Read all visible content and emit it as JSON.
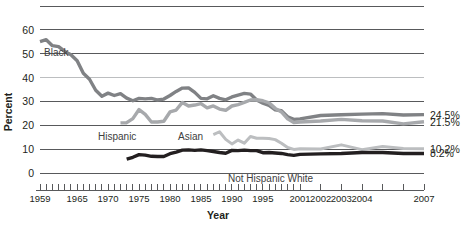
{
  "chart_data": {
    "type": "line",
    "title": "",
    "xlabel": "Year",
    "ylabel": "Percent",
    "ylim": [
      0,
      65
    ],
    "yticks": [
      0,
      10,
      20,
      30,
      40,
      50,
      60
    ],
    "xlim": [
      1959,
      2007
    ],
    "xticklabels": [
      "1959",
      "1965",
      "1970",
      "1975",
      "1980",
      "1985",
      "1990",
      "1995",
      "2001",
      "2002",
      "2003",
      "2004",
      "2007"
    ],
    "grid": true,
    "legend_position": "inline-annotations",
    "series": [
      {
        "name": "Black",
        "label": "Black",
        "color": "#808285",
        "end_value_label": "24.5%",
        "end_value": 24.5,
        "x": [
          1959,
          1960,
          1961,
          1962,
          1963,
          1964,
          1965,
          1966,
          1967,
          1968,
          1969,
          1970,
          1971,
          1972,
          1973,
          1974,
          1975,
          1976,
          1977,
          1978,
          1979,
          1980,
          1981,
          1982,
          1983,
          1984,
          1985,
          1986,
          1987,
          1988,
          1989,
          1990,
          1991,
          1992,
          1993,
          1994,
          1995,
          1996,
          1997,
          1998,
          1999,
          2000,
          2001,
          2002,
          2003,
          2004,
          2005,
          2006,
          2007
        ],
        "y": [
          55.1,
          55.9,
          53.4,
          53.0,
          51.0,
          49.6,
          47.1,
          41.8,
          39.3,
          34.7,
          32.2,
          33.5,
          32.5,
          33.3,
          31.4,
          30.3,
          31.3,
          31.1,
          31.3,
          30.6,
          31.0,
          32.5,
          34.2,
          35.6,
          35.7,
          33.8,
          31.3,
          31.1,
          32.4,
          31.3,
          30.7,
          31.9,
          32.7,
          33.4,
          33.1,
          30.6,
          29.3,
          28.4,
          26.5,
          26.1,
          23.6,
          22.5,
          22.7,
          24.1,
          24.4,
          24.7,
          24.9,
          24.3,
          24.5
        ]
      },
      {
        "name": "Hispanic",
        "label": "Hispanic",
        "color": "#a7a9ac",
        "end_value_label": "21.5%",
        "end_value": 21.5,
        "x": [
          1972,
          1973,
          1974,
          1975,
          1976,
          1977,
          1978,
          1979,
          1980,
          1981,
          1982,
          1983,
          1984,
          1985,
          1986,
          1987,
          1988,
          1989,
          1990,
          1991,
          1992,
          1993,
          1994,
          1995,
          1996,
          1997,
          1998,
          1999,
          2000,
          2001,
          2002,
          2003,
          2004,
          2005,
          2006,
          2007
        ],
        "y": [
          21.0,
          21.1,
          22.8,
          26.6,
          24.6,
          21.4,
          21.4,
          21.7,
          25.6,
          26.4,
          29.6,
          28.1,
          28.5,
          29.1,
          27.3,
          28.1,
          26.8,
          26.3,
          28.1,
          28.7,
          29.6,
          30.6,
          30.7,
          30.3,
          29.4,
          27.1,
          25.6,
          22.7,
          21.2,
          21.4,
          21.8,
          22.5,
          21.9,
          21.8,
          20.6,
          21.5
        ]
      },
      {
        "name": "Asian",
        "label": "Asian",
        "color": "#bcbec0",
        "end_value_label": "10.2%",
        "end_value": 10.2,
        "x": [
          1987,
          1988,
          1989,
          1990,
          1991,
          1992,
          1993,
          1994,
          1995,
          1996,
          1997,
          1998,
          1999,
          2000,
          2001,
          2002,
          2003,
          2004,
          2005,
          2006,
          2007
        ],
        "y": [
          16.1,
          17.3,
          14.1,
          12.2,
          13.8,
          12.5,
          15.3,
          14.6,
          14.6,
          14.5,
          14.0,
          12.5,
          10.7,
          9.9,
          10.2,
          10.1,
          11.8,
          9.8,
          11.1,
          10.3,
          10.2
        ]
      },
      {
        "name": "Not Hispanic White",
        "label": "Not Hispanic White",
        "color": "#231f20",
        "end_value_label": "8.2%",
        "end_value": 8.2,
        "x": [
          1973,
          1974,
          1975,
          1976,
          1977,
          1978,
          1979,
          1980,
          1981,
          1982,
          1983,
          1984,
          1985,
          1986,
          1987,
          1988,
          1989,
          1990,
          1991,
          1992,
          1993,
          1994,
          1995,
          1996,
          1997,
          1998,
          1999,
          2000,
          2001,
          2002,
          2003,
          2004,
          2005,
          2006,
          2007
        ],
        "y": [
          5.8,
          6.6,
          7.7,
          7.5,
          7.0,
          6.9,
          6.9,
          8.1,
          8.8,
          9.6,
          9.7,
          9.5,
          9.7,
          9.4,
          9.0,
          8.6,
          8.3,
          9.5,
          9.4,
          9.6,
          9.4,
          9.4,
          8.5,
          8.6,
          8.4,
          8.2,
          7.7,
          7.4,
          7.8,
          8.0,
          8.2,
          8.6,
          8.6,
          8.2,
          8.2
        ]
      }
    ],
    "annotations": [
      {
        "text": "Black",
        "x_px": 44,
        "y_px": 56
      },
      {
        "text": "Hispanic",
        "x_px": 98,
        "y_px": 140
      },
      {
        "text": "Asian",
        "x_px": 178,
        "y_px": 140
      },
      {
        "text": "Not Hispanic White",
        "x_px": 228,
        "y_px": 182
      }
    ]
  }
}
